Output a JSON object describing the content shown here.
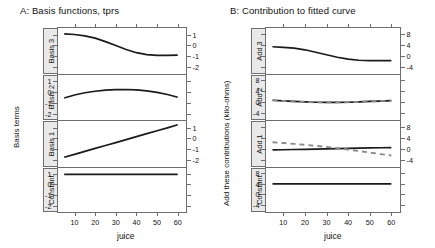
{
  "panelA": {
    "title": "A: Basis functions, tprs",
    "ylabel": "Basis terms",
    "xlabel": "juice",
    "strips": [
      "Basis 3",
      "Basis 2",
      "Basis 1",
      "Constant"
    ],
    "ytick_labels": [
      "1",
      "0",
      "-1",
      "-2"
    ],
    "xtick_labels": [
      "10",
      "20",
      "30",
      "40",
      "50",
      "60"
    ]
  },
  "panelB": {
    "title": "B: Contribution to fitted curve",
    "ylabel": "Add these contributions (kilo-ohms)",
    "xlabel": "juice",
    "strips": [
      "Add 3",
      "Add 2",
      "Add 1",
      "Constant"
    ],
    "ytick_labels": [
      "8",
      "4",
      "0",
      "-4"
    ],
    "xtick_labels": [
      "10",
      "20",
      "30",
      "40",
      "50",
      "60"
    ]
  },
  "chart_data": {
    "type": "line",
    "xlabel": "juice",
    "xlim": [
      2,
      64
    ],
    "x": [
      5,
      10,
      15,
      20,
      25,
      30,
      35,
      40,
      45,
      50,
      55,
      60
    ],
    "panels": [
      {
        "panel": "A",
        "title": "A: Basis functions, tprs",
        "ylabel": "Basis terms",
        "ylim": [
          -2.6,
          1.6
        ],
        "yticks": [
          1,
          0,
          -1,
          -2
        ],
        "rows": [
          {
            "strip": "Basis 3",
            "yaxis_side": "right",
            "series": [
              {
                "name": "basis 3",
                "style": "solid",
                "color": "#1a1a1a",
                "values": [
                  1.05,
                  1.0,
                  0.88,
                  0.66,
                  0.34,
                  -0.02,
                  -0.38,
                  -0.68,
                  -0.85,
                  -0.92,
                  -0.93,
                  -0.9
                ]
              }
            ]
          },
          {
            "strip": "Basis 2",
            "yaxis_side": "left",
            "series": [
              {
                "name": "basis 2",
                "style": "solid",
                "color": "#1a1a1a",
                "values": [
                  -0.52,
                  -0.25,
                  -0.04,
                  0.1,
                  0.2,
                  0.25,
                  0.26,
                  0.22,
                  0.13,
                  0.0,
                  -0.2,
                  -0.45
                ]
              }
            ]
          },
          {
            "strip": "Basis 1",
            "yaxis_side": "right",
            "series": [
              {
                "name": "basis 1",
                "style": "solid",
                "color": "#1a1a1a",
                "values": [
                  -1.75,
                  -1.48,
                  -1.2,
                  -0.93,
                  -0.66,
                  -0.39,
                  -0.12,
                  0.16,
                  0.43,
                  0.7,
                  0.97,
                  1.25
                ]
              }
            ]
          },
          {
            "strip": "Constant",
            "yaxis_side": "left",
            "series": [
              {
                "name": "constant",
                "style": "solid",
                "color": "#1a1a1a",
                "values": [
                  1,
                  1,
                  1,
                  1,
                  1,
                  1,
                  1,
                  1,
                  1,
                  1,
                  1,
                  1
                ]
              }
            ]
          }
        ]
      },
      {
        "panel": "B",
        "title": "B: Contribution to fitted curve",
        "ylabel": "Add these contributions (kilo-ohms)",
        "ylim": [
          -6.5,
          10
        ],
        "yticks": [
          8,
          4,
          0,
          -4
        ],
        "rows": [
          {
            "strip": "Add 3",
            "yaxis_side": "right",
            "series": [
              {
                "name": "add 3",
                "style": "solid",
                "color": "#1a1a1a",
                "values": [
                  3.2,
                  3.0,
                  2.7,
                  2.1,
                  1.2,
                  0.3,
                  -0.6,
                  -1.3,
                  -1.7,
                  -1.85,
                  -1.85,
                  -1.8
                ]
              }
            ]
          },
          {
            "strip": "Add 2",
            "yaxis_side": "left",
            "series": [
              {
                "name": "add 2 solid",
                "style": "solid",
                "color": "#1a1a1a",
                "values": [
                  0.85,
                  0.6,
                  0.4,
                  0.25,
                  0.12,
                  0.05,
                  0.05,
                  0.12,
                  0.25,
                  0.4,
                  0.55,
                  0.7
                ]
              },
              {
                "name": "add 2 dashed",
                "style": "dashed",
                "color": "#8a8a8a",
                "values": [
                  0.8,
                  0.58,
                  0.38,
                  0.24,
                  0.12,
                  0.06,
                  0.06,
                  0.13,
                  0.26,
                  0.4,
                  0.56,
                  0.72
                ]
              }
            ]
          },
          {
            "strip": "Add 1",
            "yaxis_side": "right",
            "series": [
              {
                "name": "add 1 solid",
                "style": "solid",
                "color": "#1a1a1a",
                "values": [
                  -0.5,
                  -0.42,
                  -0.34,
                  -0.26,
                  -0.18,
                  -0.1,
                  -0.02,
                  0.06,
                  0.14,
                  0.22,
                  0.3,
                  0.38
                ]
              },
              {
                "name": "add 1 dashed",
                "style": "dashed",
                "color": "#8a8a8a",
                "values": [
                  2.3,
                  2.0,
                  1.7,
                  1.35,
                  1.0,
                  0.6,
                  0.15,
                  -0.35,
                  -0.9,
                  -1.45,
                  -2.0,
                  -2.5
                ]
              }
            ]
          },
          {
            "strip": "Constant",
            "yaxis_side": "left",
            "series": [
              {
                "name": "constant",
                "style": "solid",
                "color": "#1a1a1a",
                "values": [
                  4.1,
                  4.1,
                  4.1,
                  4.1,
                  4.1,
                  4.1,
                  4.1,
                  4.1,
                  4.1,
                  4.1,
                  4.1,
                  4.1
                ]
              }
            ]
          }
        ]
      }
    ]
  }
}
